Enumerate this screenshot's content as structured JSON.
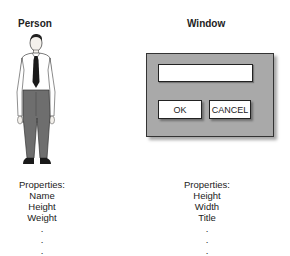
{
  "person": {
    "title": "Person",
    "figure_icon": "person-figure",
    "properties_label": "Properties:",
    "properties": [
      "Name",
      "Height",
      "Weight"
    ],
    "continuation": [
      ".",
      ".",
      "."
    ]
  },
  "window": {
    "title": "Window",
    "text_field_value": "",
    "ok_label": "OK",
    "cancel_label": "CANCEL",
    "properties_label": "Properties:",
    "properties": [
      "Height",
      "Width",
      "Title"
    ],
    "continuation": [
      ".",
      ".",
      "."
    ],
    "colors": {
      "frame": "#a9a9a9",
      "border": "#333333"
    }
  }
}
